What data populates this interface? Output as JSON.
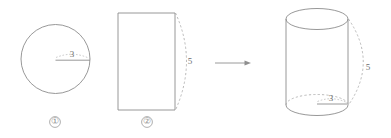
{
  "diagram": {
    "stroke_color": "#8c8c8c",
    "dash_color": "#a8a8a8",
    "text_color": "#6e6e6e",
    "background": "#ffffff"
  },
  "figures": {
    "circle": {
      "caption": "①",
      "radius_label": "3",
      "center_x": 55.5,
      "center_y": 59,
      "radius_px": 34.5
    },
    "rectangle": {
      "caption": "②",
      "height_label": "5",
      "left": 118,
      "top": 13,
      "width": 57,
      "height": 97
    },
    "arrow": {
      "name": "transform-arrow",
      "from_x": 215,
      "to_x": 251,
      "y": 63
    },
    "cylinder": {
      "radius_label": "3",
      "height_label": "5",
      "left": 286,
      "right": 348,
      "top_center_y": 19,
      "bottom_center_y": 105,
      "ellipse_ry": 10.5
    }
  },
  "labels": {
    "circle_radius": "3",
    "rectangle_height": "5",
    "cylinder_radius": "3",
    "cylinder_height": "5",
    "figure_one": "①",
    "figure_two": "②"
  }
}
